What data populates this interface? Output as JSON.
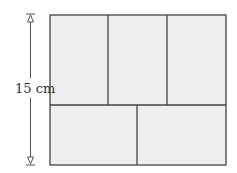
{
  "diagram": {
    "dimension_label": "15 cm",
    "colors": {
      "fill": "#efefef",
      "stroke": "#444444",
      "arrow": "#555555"
    },
    "outer": {
      "x": 50,
      "y": 15,
      "w": 176,
      "h": 150
    },
    "rows": [
      {
        "name": "top-row",
        "pieces": 3
      },
      {
        "name": "bottom-row",
        "pieces": 2
      }
    ]
  }
}
